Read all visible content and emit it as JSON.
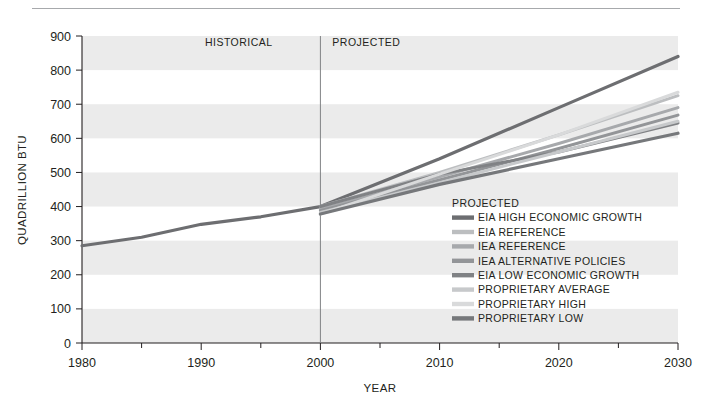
{
  "chart_data": {
    "type": "line",
    "title": "",
    "xlabel": "YEAR",
    "ylabel": "QUADRILLION BTU",
    "xlim": [
      1980,
      2030
    ],
    "ylim": [
      0,
      900
    ],
    "grid": "horizontal-bands",
    "x_ticks": [
      1980,
      1990,
      2000,
      2010,
      2020,
      2030
    ],
    "x_minor_ticks": [
      1985,
      1995,
      2005,
      2015,
      2025
    ],
    "y_ticks": [
      0,
      100,
      200,
      300,
      400,
      500,
      600,
      700,
      800,
      900
    ],
    "x_tick_labels": [
      "1980",
      "1990",
      "2000",
      "2010",
      "2020",
      "2030"
    ],
    "y_tick_labels": [
      "0",
      "100",
      "200",
      "300",
      "400",
      "500",
      "600",
      "700",
      "800",
      "900"
    ],
    "annotations": [
      {
        "text": "HISTORICAL",
        "x": 1996,
        "y": 870,
        "align": "end"
      },
      {
        "text": "PROJECTED",
        "x": 2001,
        "y": 870,
        "align": "start"
      }
    ],
    "divider_x": 2000,
    "legend": {
      "title": "PROJECTED",
      "position": "inside-center-right",
      "entries": [
        {
          "label": "EIA HIGH ECONOMIC GROWTH",
          "color": "#6d6e71"
        },
        {
          "label": "EIA REFERENCE",
          "color": "#bcbec0"
        },
        {
          "label": "IEA REFERENCE",
          "color": "#a7a9ac"
        },
        {
          "label": "IEA ALTERNATIVE POLICIES",
          "color": "#939598"
        },
        {
          "label": "EIA LOW ECONOMIC GROWTH",
          "color": "#808285"
        },
        {
          "label": "PROPRIETARY AVERAGE",
          "color": "#c7c9cb"
        },
        {
          "label": "PROPRIETARY HIGH",
          "color": "#d9dadb"
        },
        {
          "label": "PROPRIETARY LOW",
          "color": "#76787b"
        }
      ]
    },
    "series": [
      {
        "name": "HISTORICAL",
        "color": "#6d6e71",
        "width": 3.2,
        "x": [
          1980,
          1985,
          1990,
          1995,
          2000
        ],
        "values": [
          285,
          310,
          348,
          370,
          400
        ]
      },
      {
        "name": "EIA HIGH ECONOMIC GROWTH",
        "color": "#6d6e71",
        "width": 3.2,
        "x": [
          2000,
          2010,
          2020,
          2030
        ],
        "values": [
          400,
          540,
          690,
          840
        ]
      },
      {
        "name": "EIA REFERENCE",
        "color": "#bcbec0",
        "width": 3.0,
        "x": [
          2000,
          2010,
          2020,
          2030
        ],
        "values": [
          400,
          500,
          610,
          725
        ]
      },
      {
        "name": "IEA REFERENCE",
        "color": "#a7a9ac",
        "width": 3.0,
        "x": [
          2000,
          2010,
          2020,
          2030
        ],
        "values": [
          392,
          487,
          585,
          690
        ]
      },
      {
        "name": "IEA ALTERNATIVE POLICIES",
        "color": "#939598",
        "width": 3.0,
        "x": [
          2000,
          2010,
          2020,
          2030
        ],
        "values": [
          388,
          478,
          570,
          668
        ]
      },
      {
        "name": "EIA LOW ECONOMIC GROWTH",
        "color": "#808285",
        "width": 3.0,
        "x": [
          2000,
          2010,
          2020,
          2030
        ],
        "values": [
          400,
          495,
          560,
          645
        ]
      },
      {
        "name": "PROPRIETARY AVERAGE",
        "color": "#c7c9cb",
        "width": 3.0,
        "x": [
          2000,
          2010,
          2020,
          2030
        ],
        "values": [
          383,
          470,
          560,
          650
        ]
      },
      {
        "name": "PROPRIETARY HIGH",
        "color": "#d9dadb",
        "width": 3.0,
        "x": [
          2000,
          2010,
          2020,
          2030
        ],
        "values": [
          378,
          495,
          610,
          735
        ]
      },
      {
        "name": "PROPRIETARY LOW",
        "color": "#76787b",
        "width": 3.2,
        "x": [
          2000,
          2010,
          2020,
          2030
        ],
        "values": [
          378,
          465,
          540,
          615
        ]
      }
    ],
    "band_color": "#ebebeb",
    "axis_color": "#231f20",
    "divider_color": "#808285"
  }
}
